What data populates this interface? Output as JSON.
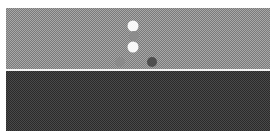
{
  "board": {
    "upper_color": "#a8a8a8",
    "lower_color": "#4a4a4a",
    "divider_color": "#f4f4f4"
  },
  "pieces": [
    {
      "name": "white-piece-top",
      "x": 133,
      "y": 26,
      "size": 11,
      "color": "#f8f8f8"
    },
    {
      "name": "gray-piece-middle",
      "x": 134,
      "y": 36,
      "size": 10,
      "color": "#8c8c8c"
    },
    {
      "name": "white-piece-lower",
      "x": 133,
      "y": 47,
      "size": 11,
      "color": "#f8f8f8"
    },
    {
      "name": "gray-piece-left",
      "x": 120,
      "y": 62,
      "size": 10,
      "color": "#8a8a8a"
    },
    {
      "name": "dark-piece-right",
      "x": 152,
      "y": 62,
      "size": 10,
      "color": "#4e4e4e"
    }
  ]
}
